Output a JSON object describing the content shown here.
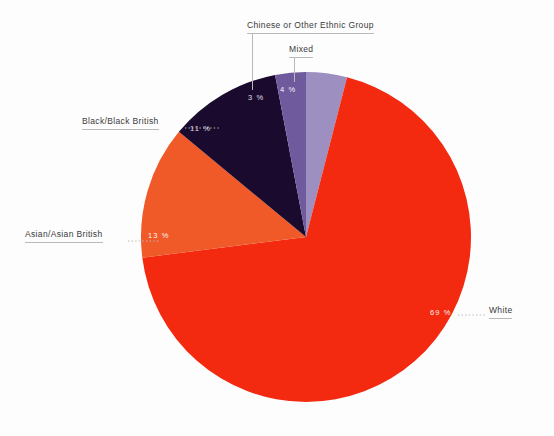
{
  "chart_data": {
    "type": "pie",
    "title": "",
    "subtitle": "",
    "xlabel": "",
    "ylabel": "",
    "legend_position": "callout-labels",
    "grid": false,
    "unit": "%",
    "categories": [
      "White",
      "Asian/Asian British",
      "Black/Black British",
      "Chinese or Other Ethnic Group",
      "Mixed"
    ],
    "values": [
      69,
      13,
      11,
      3,
      4
    ],
    "value_labels": [
      "69 %",
      "13 %",
      "11 %",
      "3 %",
      "4 %"
    ],
    "colors": [
      "#f42a10",
      "#ef5a28",
      "#1a0b2e",
      "#6f5a9e",
      "#9d8fc0"
    ],
    "slices": [
      {
        "label": "Mixed",
        "value": 4,
        "value_label": "4 %",
        "color": "#9d8fc0",
        "start_angle": 0,
        "end_angle": 14.4
      },
      {
        "label": "White",
        "value": 69,
        "value_label": "69 %",
        "color": "#f42a10",
        "start_angle": 14.4,
        "end_angle": 262.8
      },
      {
        "label": "Asian/Asian British",
        "value": 13,
        "value_label": "13 %",
        "color": "#ef5a28",
        "start_angle": 262.8,
        "end_angle": 309.6
      },
      {
        "label": "Black/Black British",
        "value": 11,
        "value_label": "11 %",
        "color": "#1a0b2e",
        "start_angle": 309.6,
        "end_angle": 349.2
      },
      {
        "label": "Chinese or Other Ethnic Group",
        "value": 3,
        "value_label": "3 %",
        "color": "#6f5a9e",
        "start_angle": 349.2,
        "end_angle": 360
      }
    ]
  },
  "labels": {
    "chinese": "Chinese or Other Ethnic Group",
    "mixed": "Mixed",
    "black": "Black/Black British",
    "asian": "Asian/Asian British",
    "white": "White"
  },
  "percentages": {
    "chinese": "3 %",
    "mixed": "4 %",
    "black": "11 %",
    "asian": "13 %",
    "white": "69 %"
  },
  "style": {
    "background": "#fdfdfd",
    "leader_color": "#b9b9b9",
    "text_color": "#3a3a3a"
  }
}
